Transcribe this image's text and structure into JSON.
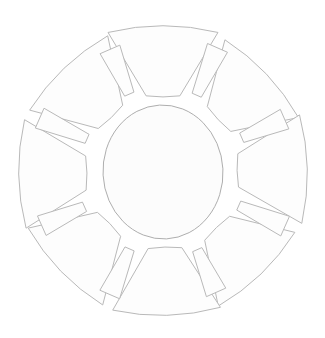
{
  "figure": {
    "kind": "line-art radial diagram",
    "background_color": "#ffffff",
    "stroke_color": "#b9b9b9",
    "fill_color": "#fdfdfd",
    "core_stroke_color": "#aeaeae",
    "stroke_width": 1,
    "canvas": {
      "width": 325,
      "height": 338
    },
    "center": {
      "x": 163,
      "y": 172
    },
    "petal_count": 8,
    "ray_count": 8,
    "element_count": 16
  },
  "core": {
    "label": "center-oval",
    "shape": "egg-shaped oval",
    "center_x": 163,
    "center_y": 172,
    "radius_x": 60,
    "radius_y": 67
  },
  "petals": [
    {
      "label": "petal-n",
      "angle": -90,
      "index": 0
    },
    {
      "label": "petal-ne",
      "angle": -45,
      "index": 1
    },
    {
      "label": "petal-e",
      "angle": 0,
      "index": 2
    },
    {
      "label": "petal-se",
      "angle": 45,
      "index": 3
    },
    {
      "label": "petal-s",
      "angle": 90,
      "index": 4
    },
    {
      "label": "petal-sw",
      "angle": 135,
      "index": 5
    },
    {
      "label": "petal-w",
      "angle": 180,
      "index": 6
    },
    {
      "label": "petal-nw",
      "angle": -135,
      "index": 7
    }
  ],
  "rays": [
    {
      "label": "ray-nne",
      "angle": -67.5,
      "index": 0
    },
    {
      "label": "ray-ene",
      "angle": -22.5,
      "index": 1
    },
    {
      "label": "ray-ese",
      "angle": 22.5,
      "index": 2
    },
    {
      "label": "ray-sse",
      "angle": 67.5,
      "index": 3
    },
    {
      "label": "ray-ssw",
      "angle": 112.5,
      "index": 4
    },
    {
      "label": "ray-wsw",
      "angle": 157.5,
      "index": 5
    },
    {
      "label": "ray-wnw",
      "angle": -157.5,
      "index": 6
    },
    {
      "label": "ray-nnw",
      "angle": -112.5,
      "index": 7
    }
  ]
}
